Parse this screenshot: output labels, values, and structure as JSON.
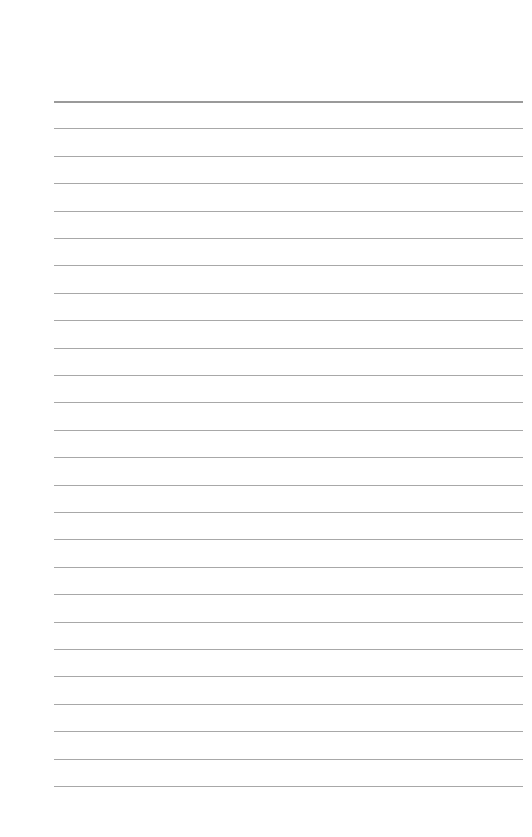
{
  "page": {
    "type": "lined-paper",
    "line_count": 26,
    "line_color": "#a8a8a8",
    "first_line_y": 101,
    "line_spacing": 27.4,
    "line_left": 54,
    "line_right": 523,
    "background": "#ffffff"
  }
}
